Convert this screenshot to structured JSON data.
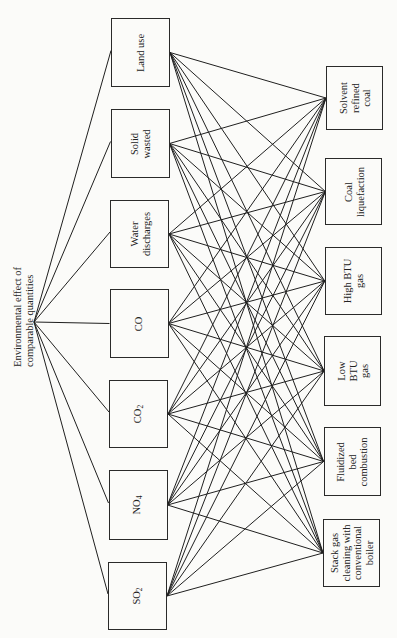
{
  "root": {
    "label": "Environmental effect of\ncomparable quantities"
  },
  "criteria": [
    {
      "id": "land-use",
      "label": "Land use",
      "y1": 18,
      "y2": 87
    },
    {
      "id": "solid-wasted",
      "label": "Solid\nwasted",
      "y1": 109,
      "y2": 178
    },
    {
      "id": "water-discharges",
      "label": "Water\ndischarges",
      "y1": 200,
      "y2": 268
    },
    {
      "id": "co",
      "label": "CO",
      "y1": 289,
      "y2": 358
    },
    {
      "id": "co2",
      "label": "CO",
      "sub": "2",
      "y1": 380,
      "y2": 448
    },
    {
      "id": "no4",
      "label": "NO",
      "sub": "4",
      "y1": 470,
      "y2": 540
    },
    {
      "id": "so2",
      "label": "SO",
      "sub": "2",
      "y1": 562,
      "y2": 630
    }
  ],
  "alternatives": [
    {
      "id": "solvent-refined-coal",
      "label": "Solvent\nrefined\ncoal",
      "y1": 66,
      "y2": 130
    },
    {
      "id": "coal-liquefaction",
      "label": "Coal\nliquefaction",
      "y1": 158,
      "y2": 225
    },
    {
      "id": "high-btu-gas",
      "label": "High BTU\ngas",
      "y1": 247,
      "y2": 315
    },
    {
      "id": "low-btu-gas",
      "label": "Low\nBTU\ngas",
      "y1": 336,
      "y2": 406
    },
    {
      "id": "fluidized-bed-combustion",
      "label": "Fluidized\nbed\ncombustion",
      "y1": 427,
      "y2": 496
    },
    {
      "id": "stack-gas-cleaning",
      "label": "Stack gas\ncleaning with\nconventional\nboiler",
      "y1": 519,
      "y2": 587
    }
  ],
  "colors": {
    "line": "#1f1f1f",
    "background": "#fbfbf9"
  }
}
